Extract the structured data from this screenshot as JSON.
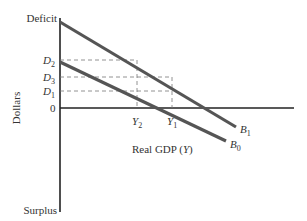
{
  "diagram": {
    "y_axis": {
      "label": "Dollars",
      "top_label": "Deficit",
      "bottom_label": "Surplus",
      "ticks": [
        {
          "main": "D",
          "sub": "2"
        },
        {
          "main": "D",
          "sub": "3"
        },
        {
          "main": "D",
          "sub": "1"
        },
        {
          "main": "0",
          "sub": ""
        }
      ]
    },
    "x_axis": {
      "label": "Real GDP (Y)",
      "label_prefix": "Real GDP (",
      "label_var": "Y",
      "label_suffix": ")",
      "ticks": [
        {
          "main": "Y",
          "sub": "2"
        },
        {
          "main": "Y",
          "sub": "1"
        }
      ]
    },
    "lines": [
      {
        "main": "B",
        "sub": "1"
      },
      {
        "main": "B",
        "sub": "0"
      }
    ],
    "line_color": "#555555"
  }
}
